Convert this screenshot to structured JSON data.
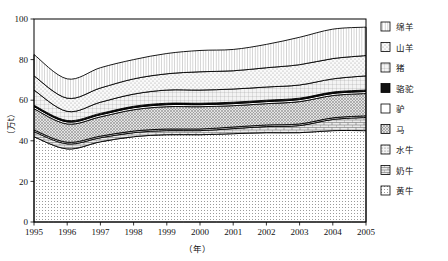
{
  "chart_data": {
    "type": "area",
    "stacked": true,
    "title": "",
    "xlabel": "（年）",
    "ylabel": "（万t）",
    "x": [
      1995,
      1996,
      1997,
      1998,
      1999,
      2000,
      2001,
      2002,
      2003,
      2004,
      2005
    ],
    "categories": [
      "1995",
      "1996",
      "1997",
      "1998",
      "1999",
      "2000",
      "2001",
      "2002",
      "2003",
      "2004",
      "2005"
    ],
    "xtick_labels": [
      "1995",
      "1996",
      "1997",
      "1998",
      "1999",
      "2000",
      "2001",
      "2002",
      "2003",
      "2004",
      "2005"
    ],
    "ytick_labels": [
      "0",
      "20",
      "40",
      "60",
      "80",
      "100"
    ],
    "yticks": [
      0,
      20,
      40,
      60,
      80,
      100
    ],
    "ylim": [
      0,
      100
    ],
    "xlim": [
      1995,
      2005
    ],
    "grid": false,
    "legend_position": "right",
    "stack_order_bottom_to_top": [
      "黄牛",
      "奶牛",
      "水牛",
      "马",
      "驴",
      "骆驼",
      "猪",
      "山羊",
      "绵羊"
    ],
    "series": [
      {
        "name": "黄牛",
        "pattern": "dot-fine",
        "values": [
          42.0,
          36.0,
          39.5,
          42.0,
          43.0,
          43.0,
          43.5,
          44.0,
          44.0,
          45.0,
          45.0
        ]
      },
      {
        "name": "奶牛",
        "pattern": "brick",
        "values": [
          2.5,
          2.5,
          2.0,
          2.0,
          2.0,
          2.0,
          2.5,
          3.0,
          3.5,
          5.5,
          6.5
        ]
      },
      {
        "name": "水牛",
        "pattern": "dot-medium",
        "values": [
          0.8,
          0.8,
          0.8,
          0.8,
          0.8,
          0.8,
          0.8,
          0.8,
          0.8,
          0.8,
          0.8
        ]
      },
      {
        "name": "马",
        "pattern": "crosshatch",
        "values": [
          10.5,
          9.0,
          9.5,
          10.5,
          11.0,
          11.0,
          10.5,
          10.5,
          11.0,
          11.0,
          11.0
        ]
      },
      {
        "name": "驴",
        "pattern": "solid-white",
        "values": [
          1.0,
          1.0,
          1.0,
          1.0,
          1.0,
          1.0,
          1.0,
          1.0,
          1.0,
          1.0,
          1.0
        ]
      },
      {
        "name": "骆驼",
        "pattern": "solid-black",
        "values": [
          0.7,
          0.7,
          0.7,
          0.7,
          0.7,
          0.7,
          0.7,
          0.7,
          0.7,
          0.7,
          0.7
        ]
      },
      {
        "name": "猪",
        "pattern": "grid-fine",
        "values": [
          7.5,
          4.5,
          5.5,
          6.0,
          6.5,
          6.5,
          6.5,
          6.5,
          6.5,
          6.5,
          7.0
        ]
      },
      {
        "name": "山羊",
        "pattern": "dot-sparse",
        "values": [
          7.0,
          6.5,
          7.0,
          7.5,
          8.0,
          9.0,
          9.0,
          9.5,
          10.0,
          10.0,
          10.0
        ]
      },
      {
        "name": "绵羊",
        "pattern": "vline",
        "values": [
          10.5,
          9.5,
          10.0,
          9.5,
          10.0,
          10.5,
          10.5,
          11.5,
          13.5,
          14.5,
          14.0
        ]
      }
    ],
    "cumulative_top_totals": [
      82.5,
      70.5,
      76.0,
      80.0,
      83.0,
      84.5,
      84.5,
      87.5,
      91.0,
      95.5,
      96.0
    ]
  },
  "legend": {
    "items": [
      {
        "label": "绵羊",
        "pattern": "vline"
      },
      {
        "label": "山羊",
        "pattern": "dot-sparse"
      },
      {
        "label": "猪",
        "pattern": "grid-fine"
      },
      {
        "label": "骆驼",
        "pattern": "solid-black"
      },
      {
        "label": "驴",
        "pattern": "solid-white"
      },
      {
        "label": "马",
        "pattern": "crosshatch"
      },
      {
        "label": "水牛",
        "pattern": "dot-medium"
      },
      {
        "label": "奶牛",
        "pattern": "brick"
      },
      {
        "label": "黄牛",
        "pattern": "dot-fine"
      }
    ]
  },
  "colors": {
    "axis": "#000000",
    "line": "#000000",
    "background": "#ffffff",
    "fill_light": "#f2f2f2"
  }
}
